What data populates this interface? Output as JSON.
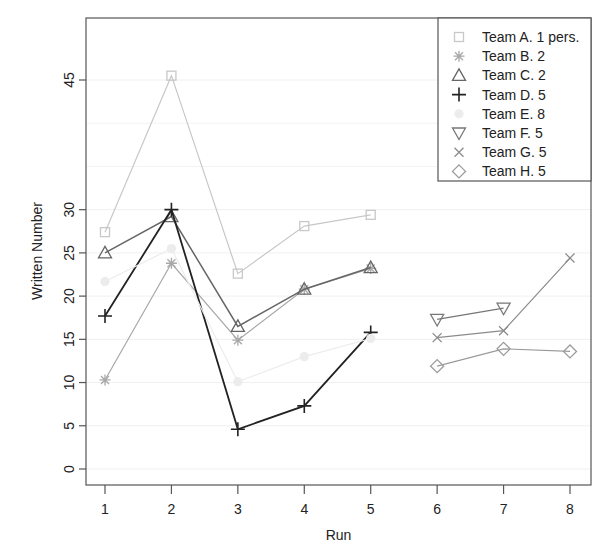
{
  "chart_data": {
    "type": "line",
    "title": "",
    "xlabel": "Run",
    "ylabel": "Written Number",
    "x": [
      1,
      2,
      3,
      4,
      5,
      6,
      7,
      8
    ],
    "x_tick_labels": [
      "1",
      "2",
      "3",
      "4",
      "5",
      "6",
      "7",
      "8"
    ],
    "y_tick_labels": [
      "0",
      "5",
      "10",
      "15",
      "20",
      "25",
      "30",
      "45"
    ],
    "y_ticks": [
      0,
      5,
      10,
      15,
      20,
      25,
      30,
      45
    ],
    "xlim": [
      0.6,
      8.3
    ],
    "ylim": [
      -1.9,
      52.2
    ],
    "grid": true,
    "legend_position": "top-right",
    "series": [
      {
        "name": "Team A. 1 pers.",
        "marker": "square",
        "color": "#c8c8c8",
        "lw": 1.2,
        "x": [
          1,
          2,
          3,
          4,
          5
        ],
        "values": [
          27.4,
          45.5,
          22.6,
          28.1,
          29.4
        ]
      },
      {
        "name": "Team B. 2",
        "marker": "asterisk",
        "color": "#a8a8a8",
        "lw": 1.2,
        "x": [
          1,
          2,
          3,
          4,
          5
        ],
        "values": [
          10.3,
          23.8,
          14.9,
          20.8,
          23.2
        ]
      },
      {
        "name": "Team C. 2",
        "marker": "triangle-up",
        "color": "#666666",
        "lw": 1.5,
        "x": [
          1,
          2,
          3,
          4,
          5
        ],
        "values": [
          25.0,
          29.2,
          16.5,
          20.8,
          23.3
        ]
      },
      {
        "name": "Team D. 5",
        "marker": "plus",
        "color": "#222222",
        "lw": 1.8,
        "x": [
          1,
          2,
          3,
          4,
          5
        ],
        "values": [
          17.7,
          30.0,
          4.6,
          7.3,
          15.8
        ]
      },
      {
        "name": "Team E. 8",
        "marker": "circle",
        "color": "#ececec",
        "lw": 1.2,
        "x": [
          1,
          2,
          3,
          4,
          5
        ],
        "values": [
          21.7,
          25.5,
          10.1,
          13.0,
          15.1
        ]
      },
      {
        "name": "Team F. 5",
        "marker": "triangle-down",
        "color": "#777777",
        "lw": 1.2,
        "x": [
          6,
          7
        ],
        "values": [
          17.3,
          18.6
        ]
      },
      {
        "name": "Team G. 5",
        "marker": "x",
        "color": "#8c8c8c",
        "lw": 1.2,
        "x": [
          6,
          7,
          8
        ],
        "values": [
          15.2,
          16.0,
          24.4
        ]
      },
      {
        "name": "Team H. 5",
        "marker": "diamond",
        "color": "#9a9a9a",
        "lw": 1.2,
        "x": [
          6,
          7,
          8
        ],
        "values": [
          11.9,
          13.9,
          13.6
        ]
      }
    ]
  }
}
